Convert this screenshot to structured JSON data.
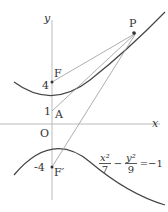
{
  "figure": {
    "axes": {
      "x_label": "x",
      "y_label": "y",
      "origin_label": "O"
    },
    "points": {
      "F": {
        "label": "F",
        "tick": "4"
      },
      "A": {
        "label": "A",
        "tick": "1"
      },
      "F_prime": {
        "label": "F′",
        "tick": "-4"
      },
      "P": {
        "label": "P"
      }
    },
    "equation": {
      "x_num": "x²",
      "x_den": "7",
      "minus": "−",
      "y_num": "y²",
      "y_den": "9",
      "rhs": "=−1"
    },
    "colors": {
      "curve": "#444444",
      "axis": "#aaaaaa",
      "line": "#888888"
    }
  }
}
